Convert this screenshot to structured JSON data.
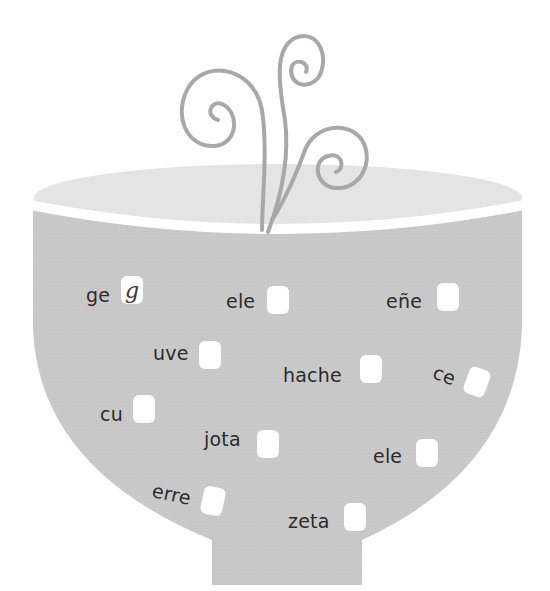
{
  "illustration": {
    "subject": "soup bowl with steam",
    "colors": {
      "bowl": "#c9c9c9",
      "soup_surface": "#e4e4e4",
      "rim": "#ffffff",
      "steam": "#a8a8a8",
      "text": "#2b2b2b",
      "box": "#ffffff"
    }
  },
  "items": [
    {
      "word": "ge",
      "answer": "g",
      "x": 86,
      "y": 286,
      "bx": 121,
      "by": 276,
      "rot": 0
    },
    {
      "word": "ele",
      "answer": "",
      "x": 226,
      "y": 292,
      "bx": 267,
      "by": 286,
      "rot": 0
    },
    {
      "word": "eñe",
      "answer": "",
      "x": 386,
      "y": 292,
      "bx": 437,
      "by": 283,
      "rot": 0
    },
    {
      "word": "uve",
      "answer": "",
      "x": 153,
      "y": 344,
      "bx": 199,
      "by": 341,
      "rot": 0
    },
    {
      "word": "hache",
      "answer": "",
      "x": 283,
      "y": 366,
      "bx": 360,
      "by": 355,
      "rot": 0
    },
    {
      "word": "ce",
      "answer": "",
      "x": 433,
      "y": 366,
      "bx": 466,
      "by": 368,
      "rot": 20
    },
    {
      "word": "cu",
      "answer": "",
      "x": 100,
      "y": 405,
      "bx": 133,
      "by": 395,
      "rot": 0
    },
    {
      "word": "jota",
      "answer": "",
      "x": 204,
      "y": 430,
      "bx": 257,
      "by": 430,
      "rot": 0
    },
    {
      "word": "ele",
      "answer": "",
      "x": 373,
      "y": 447,
      "bx": 416,
      "by": 439,
      "rot": 0
    },
    {
      "word": "erre",
      "answer": "",
      "x": 152,
      "y": 485,
      "bx": 202,
      "by": 487,
      "rot": 12
    },
    {
      "word": "zeta",
      "answer": "",
      "x": 288,
      "y": 512,
      "bx": 344,
      "by": 503,
      "rot": 0
    }
  ]
}
